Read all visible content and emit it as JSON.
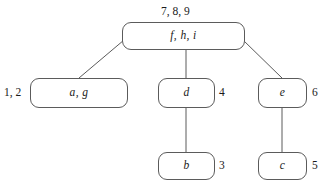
{
  "diagram": {
    "type": "tree",
    "nodes": [
      {
        "id": "root",
        "label": "f, h, i",
        "number": "7, 8, 9"
      },
      {
        "id": "ag",
        "label": "a, g",
        "number": "1, 2"
      },
      {
        "id": "d",
        "label": "d",
        "number": "4"
      },
      {
        "id": "e",
        "label": "e",
        "number": "6"
      },
      {
        "id": "b",
        "label": "b",
        "number": "3"
      },
      {
        "id": "c",
        "label": "c",
        "number": "5"
      }
    ],
    "edges": [
      {
        "from": "root",
        "to": "ag",
        "style": "diagonal"
      },
      {
        "from": "root",
        "to": "d",
        "style": "vertical"
      },
      {
        "from": "root",
        "to": "e",
        "style": "diagonal"
      },
      {
        "from": "d",
        "to": "b",
        "style": "vertical"
      },
      {
        "from": "e",
        "to": "c",
        "style": "vertical"
      }
    ],
    "colors": {
      "stroke": "#5b5b5b",
      "text": "#1a1a1a",
      "background": "#ffffff"
    }
  }
}
